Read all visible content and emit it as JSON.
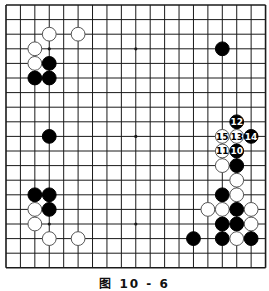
{
  "diagram": {
    "type": "go-board",
    "size": 19,
    "caption": "图 10 - 6",
    "colors": {
      "background": "#ffffff",
      "line": "#1a1a1a",
      "black_stone": "#000000",
      "white_stone": "#ffffff",
      "white_stone_border": "#555555"
    },
    "geometry": {
      "x0": 6,
      "y0": 5,
      "dx": 14.42,
      "dy": 14.6,
      "stone_r": 6.9
    },
    "star_points": [
      [
        3,
        3
      ],
      [
        9,
        3
      ],
      [
        15,
        3
      ],
      [
        3,
        9
      ],
      [
        9,
        9
      ],
      [
        15,
        9
      ],
      [
        3,
        15
      ],
      [
        9,
        15
      ],
      [
        15,
        15
      ]
    ],
    "stones": [
      {
        "color": "white",
        "col": 3,
        "row": 2
      },
      {
        "color": "white",
        "col": 5,
        "row": 2
      },
      {
        "color": "white",
        "col": 2,
        "row": 3
      },
      {
        "color": "white",
        "col": 2,
        "row": 4
      },
      {
        "color": "black",
        "col": 3,
        "row": 4
      },
      {
        "color": "black",
        "col": 2,
        "row": 5
      },
      {
        "color": "black",
        "col": 3,
        "row": 5
      },
      {
        "color": "black",
        "col": 15,
        "row": 3
      },
      {
        "color": "black",
        "col": 3,
        "row": 9
      },
      {
        "color": "black",
        "col": 2,
        "row": 13
      },
      {
        "color": "black",
        "col": 3,
        "row": 13
      },
      {
        "color": "white",
        "col": 2,
        "row": 14
      },
      {
        "color": "black",
        "col": 3,
        "row": 14
      },
      {
        "color": "white",
        "col": 2,
        "row": 15
      },
      {
        "color": "white",
        "col": 3,
        "row": 16
      },
      {
        "color": "white",
        "col": 5,
        "row": 16
      },
      {
        "color": "black",
        "col": 16,
        "row": 8,
        "label": "12"
      },
      {
        "color": "white",
        "col": 15,
        "row": 9,
        "label": "15"
      },
      {
        "color": "white",
        "col": 16,
        "row": 9,
        "label": "13"
      },
      {
        "color": "black",
        "col": 17,
        "row": 9,
        "label": "14"
      },
      {
        "color": "white",
        "col": 15,
        "row": 10,
        "label": "11"
      },
      {
        "color": "black",
        "col": 16,
        "row": 10,
        "label": "10"
      },
      {
        "color": "white",
        "col": 15,
        "row": 11
      },
      {
        "color": "black",
        "col": 16,
        "row": 11
      },
      {
        "color": "white",
        "col": 16,
        "row": 12
      },
      {
        "color": "black",
        "col": 15,
        "row": 13
      },
      {
        "color": "white",
        "col": 16,
        "row": 13
      },
      {
        "color": "white",
        "col": 14,
        "row": 14
      },
      {
        "color": "white",
        "col": 15,
        "row": 14
      },
      {
        "color": "black",
        "col": 16,
        "row": 14
      },
      {
        "color": "white",
        "col": 17,
        "row": 14
      },
      {
        "color": "black",
        "col": 15,
        "row": 15
      },
      {
        "color": "black",
        "col": 16,
        "row": 15
      },
      {
        "color": "white",
        "col": 17,
        "row": 15
      },
      {
        "color": "black",
        "col": 13,
        "row": 16
      },
      {
        "color": "black",
        "col": 15,
        "row": 16
      },
      {
        "color": "white",
        "col": 16,
        "row": 16
      },
      {
        "color": "black",
        "col": 17,
        "row": 16
      }
    ]
  }
}
